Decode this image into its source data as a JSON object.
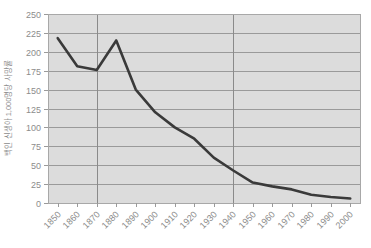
{
  "chart_data": {
    "type": "line",
    "title": "",
    "xlabel": "",
    "ylabel": "백인 신생아 1,000명당 사망률",
    "x": [
      1850,
      1860,
      1870,
      1880,
      1890,
      1900,
      1910,
      1920,
      1930,
      1940,
      1950,
      1960,
      1970,
      1980,
      1990,
      2000
    ],
    "categories": [
      "1850",
      "1860",
      "1870",
      "1880",
      "1890",
      "1900",
      "1910",
      "1920",
      "1930",
      "1940",
      "1950",
      "1960",
      "1970",
      "1980",
      "1990",
      "2000"
    ],
    "values": [
      218,
      181,
      176,
      215,
      150,
      120,
      100,
      85,
      60,
      43,
      27,
      22,
      18,
      11,
      8,
      6
    ],
    "series": [
      {
        "name": "백인 신생아 사망률",
        "values": [
          218,
          181,
          176,
          215,
          150,
          120,
          100,
          85,
          60,
          43,
          27,
          22,
          18,
          11,
          8,
          6
        ],
        "color": "#3a3a3a"
      }
    ],
    "ylim": [
      0,
      250
    ],
    "yticks": [
      0,
      25,
      50,
      75,
      100,
      125,
      150,
      175,
      200,
      225,
      250
    ],
    "ytick_labels": [
      "0",
      "25",
      "50",
      "75",
      "100",
      "125",
      "150",
      "175",
      "200",
      "225",
      "250"
    ],
    "xlim": [
      1845,
      2005
    ],
    "grid": true,
    "grid_horizontal": true,
    "grid_vertical_highlights": [
      1870,
      1940
    ],
    "legend": null,
    "legend_position": "none",
    "plot_background": "#dcdcdc",
    "page_background": "#ffffff",
    "gridline_color": "#9a9a9a",
    "axis_text_color": "#8c8c8c",
    "xtick_label_rotation": -45
  }
}
